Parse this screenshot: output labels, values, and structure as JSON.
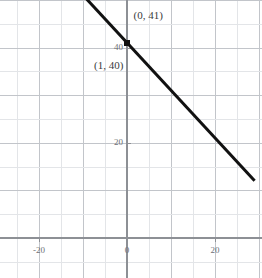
{
  "chart_data": {
    "type": "line",
    "title": "",
    "xlabel": "",
    "ylabel": "",
    "xlim": [
      -27,
      29
    ],
    "ylim": [
      -10,
      50
    ],
    "grid": true,
    "legend": false,
    "equation": "y = -x + 41",
    "slope": -1,
    "intercept": 41,
    "x_ticks": [
      -20,
      0,
      20
    ],
    "x_tick_labels": [
      "-20",
      "0",
      "20"
    ],
    "y_ticks": [
      20,
      40
    ],
    "y_tick_labels": [
      "20",
      "40"
    ],
    "grid_step_minor": 5,
    "grid_step_major": 10,
    "series": [
      {
        "name": "line",
        "x": [
          -27,
          29
        ],
        "y": [
          68,
          12
        ],
        "color": "#111111"
      }
    ],
    "points": [
      {
        "x": 0,
        "y": 41,
        "label": "(0, 41)",
        "marker": "square"
      },
      {
        "x": 1,
        "y": 40,
        "label": "(1, 40)",
        "marker": "none"
      }
    ],
    "annotations": [
      {
        "text": "(0, 41)",
        "x": 1.5,
        "y": 46.5
      },
      {
        "text": "(1, 40)",
        "x": -7.5,
        "y": 36.0
      }
    ],
    "colors": {
      "line": "#111111",
      "marker": "#111111",
      "axis": "#8d9095",
      "grid_major": "#c2c5ca",
      "grid_minor": "#e3e5e8",
      "tick_text": "#6d7075",
      "annotation_text": "#3a3c40",
      "background": "#ffffff"
    }
  }
}
